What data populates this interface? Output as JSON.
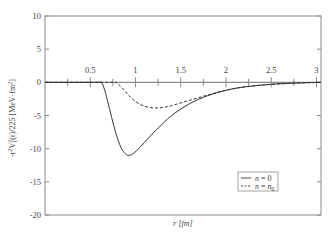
{
  "chart_data": {
    "type": "line",
    "title": "",
    "xlabel": "r [fm]",
    "ylabel": "-r²V₁²(r)/225 [MeV·fm²]",
    "xlim": [
      0,
      3.05
    ],
    "ylim": [
      -20,
      10
    ],
    "x_ticks": [
      "0.5",
      "1",
      "1.5",
      "2",
      "2.5",
      "3"
    ],
    "x_tick_values": [
      0.5,
      1,
      1.5,
      2,
      2.5,
      3
    ],
    "y_ticks": [
      "10",
      "5",
      "0",
      "-5",
      "-10",
      "-15",
      "-20"
    ],
    "y_tick_values": [
      10,
      5,
      0,
      -5,
      -10,
      -15,
      -20
    ],
    "x_axis_position": "y=0 (inside plot)",
    "grid": false,
    "legend_position": "lower right",
    "series": [
      {
        "name": "n = 0",
        "style": "solid",
        "x": [
          0.0,
          0.55,
          0.62,
          0.66,
          0.7,
          0.75,
          0.8,
          0.85,
          0.9,
          0.93,
          0.97,
          1.05,
          1.15,
          1.25,
          1.4,
          1.6,
          1.8,
          2.0,
          2.2,
          2.5,
          2.8,
          3.05
        ],
        "values": [
          0,
          0,
          0,
          -1.2,
          -3.3,
          -6.0,
          -8.4,
          -10.1,
          -10.9,
          -11.0,
          -10.8,
          -9.8,
          -8.3,
          -6.9,
          -5.0,
          -3.2,
          -2.0,
          -1.2,
          -0.7,
          -0.3,
          -0.1,
          0
        ]
      },
      {
        "name": "n = n₀",
        "style": "dashed",
        "x": [
          0.0,
          0.7,
          0.78,
          0.85,
          0.92,
          1.0,
          1.1,
          1.2,
          1.3,
          1.4,
          1.6,
          1.8,
          2.0,
          2.2,
          2.5,
          2.8,
          3.05
        ],
        "values": [
          0,
          0,
          0,
          -0.8,
          -1.9,
          -2.9,
          -3.6,
          -3.85,
          -3.8,
          -3.5,
          -2.7,
          -1.9,
          -1.2,
          -0.7,
          -0.3,
          -0.1,
          0
        ]
      }
    ]
  },
  "legend": {
    "items": [
      {
        "label_var": "n",
        "label_eq": "= 0",
        "style": "solid"
      },
      {
        "label_var": "n",
        "label_eq": "= n",
        "label_sub": "0",
        "style": "dashed"
      }
    ]
  },
  "labels": {
    "x_axis": "r [fm]",
    "y_axis_main": "-r",
    "y_axis_sup1": "2",
    "y_axis_mid": "V",
    "y_axis_sub": "1",
    "y_axis_sup2": "2",
    "y_axis_tail": "(r)/225  [MeV·fm",
    "y_axis_sup3": "2",
    "y_axis_end": "]"
  },
  "colors": {
    "frame": "#8a8a8a",
    "curve": "#333333",
    "text": "#444444"
  }
}
